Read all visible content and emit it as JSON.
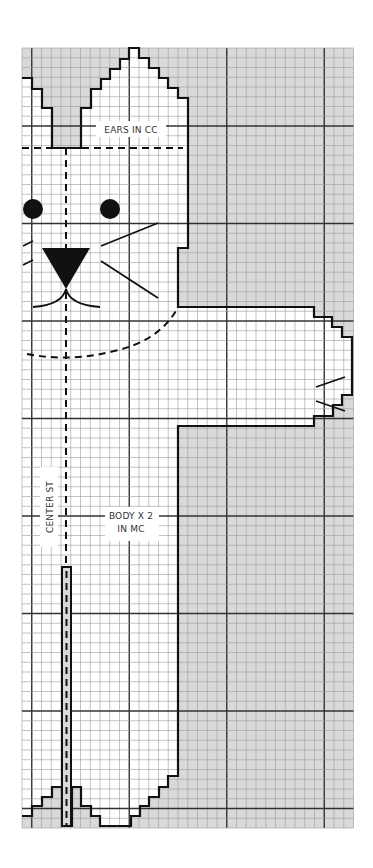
{
  "diagram": {
    "type": "knitting-chart",
    "grid": {
      "origin_x": 22,
      "origin_y": 48,
      "cell": 9.75,
      "cols": 34,
      "rows": 80,
      "major_every": 10,
      "major_offset_col": 1,
      "major_offset_row": 8,
      "bg_color": "#d9d9d9",
      "fill_color": "#ffffff",
      "minor_color": "#9a9a9a",
      "major_color": "#333333",
      "outline_color": "#111111"
    },
    "labels": {
      "ears": "EARS IN CC",
      "body_line1": "BODY X 2",
      "body_line2": "IN MC",
      "center": "CENTER ST"
    },
    "features": {
      "eyes": [
        {
          "cx": 33,
          "cy": 209,
          "r": 10
        },
        {
          "cx": 110,
          "cy": 209,
          "r": 10
        }
      ],
      "nose": "42,248 90,248 66,289",
      "whiskers": [
        "23,246 33,241",
        "23,265 33,260",
        "101,246 158,223",
        "101,261 158,298",
        "316,387 345,377",
        "316,401 345,411"
      ],
      "center_stitch_x": 66,
      "slot": {
        "x": 62,
        "y": 567,
        "w": 9,
        "h": 259
      }
    },
    "outline_points": "22,78 32,78 32,89 42,89 42,108 52,108 52,148 81,148 81,108 91,108 91,89 101,89 101,79 110,79 110,69 120,69 120,59 129,59 129,48 139,48 139,58 149,58 149,68 159,68 159,78 168,78 168,88 178,88 178,98 188,98 188,248 178,248 178,307 314,307 314,317 332,317 332,327 342,327 342,337 352,337 352,395 342,395 342,405 333,405 333,416 314,416 314,426 178,426 178,776 168,776 168,787 159,787 159,797 149,797 149,806 140,806 140,816 131,816 131,826 100,826 100,816 91,816 91,806 81,806 81,787 72,787 72,826 62,826 62,787 52,787 52,797 42,797 42,806 32,806 32,816 22,816"
  }
}
